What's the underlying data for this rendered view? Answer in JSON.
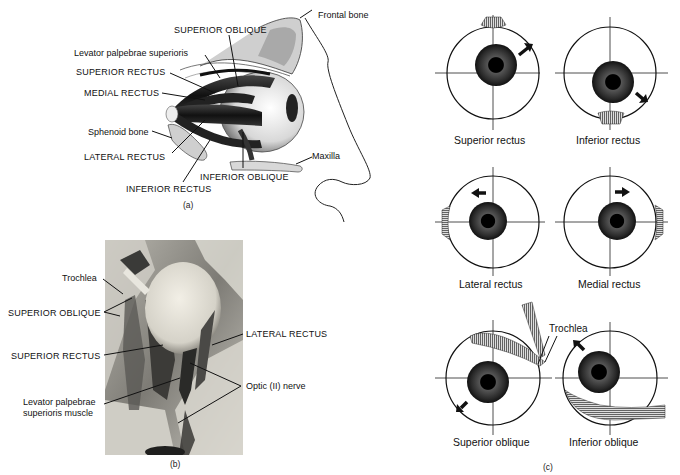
{
  "figure": {
    "panel_a": {
      "id_label": "(a)",
      "labels": {
        "frontal_bone": "Frontal bone",
        "superior_oblique": "SUPERIOR  OBLIQUE",
        "levator": "Levator palpebrae superioris",
        "superior_rectus": "SUPERIOR RECTUS",
        "medial_rectus": "MEDIAL  RECTUS",
        "sphenoid_bone": "Sphenoid bone",
        "lateral_rectus": "LATERAL  RECTUS",
        "inferior_rectus": "INFERIOR RECTUS",
        "inferior_oblique": "INFERIOR  OBLIQUE",
        "maxilla": "Maxilla"
      }
    },
    "panel_b": {
      "id_label": "(b)",
      "labels": {
        "trochlea": "Trochlea",
        "superior_oblique": "SUPERIOR OBLIQUE",
        "superior_rectus": "SUPERIOR RECTUS",
        "levator_line1": "Levator palpebrae",
        "levator_line2": "superioris muscle",
        "lateral_rectus": "LATERAL RECTUS",
        "optic_nerve": "Optic (II) nerve"
      }
    },
    "panel_c": {
      "id_label": "(c)",
      "diagrams": [
        {
          "caption": "Superior rectus",
          "arrow": "up-right"
        },
        {
          "caption": "Inferior rectus",
          "arrow": "down-right"
        },
        {
          "caption": "Lateral rectus",
          "arrow": "left"
        },
        {
          "caption": "Medial rectus",
          "arrow": "right"
        },
        {
          "caption": "Superior oblique",
          "arrow": "down-left"
        },
        {
          "caption": "Inferior oblique",
          "arrow": "up-left"
        }
      ],
      "trochlea_label": "Trochlea"
    }
  }
}
